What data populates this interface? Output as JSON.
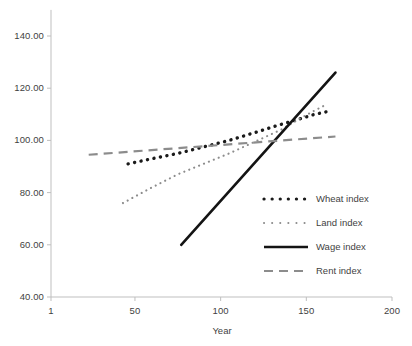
{
  "chart_data": {
    "type": "line",
    "title": "",
    "xlabel": "Year",
    "ylabel": "",
    "xlim": [
      1,
      200
    ],
    "ylim": [
      40,
      150
    ],
    "grid": false,
    "legend_position": "inside-right",
    "x_ticks": [
      "1",
      "50",
      "100",
      "150",
      "200"
    ],
    "x_tick_values": [
      1,
      50,
      100,
      150,
      200
    ],
    "y_ticks": [
      "40.00",
      "60.00",
      "80.00",
      "100.00",
      "120.00",
      "140.00"
    ],
    "y_tick_values": [
      40,
      60,
      80,
      100,
      120,
      140
    ],
    "series": [
      {
        "name": "Wheat index",
        "style": "dotted-bold",
        "color": "#1a1a1a",
        "x": [
          46,
          162
        ],
        "values": [
          91,
          111
        ],
        "points": [
          {
            "x": 46,
            "y": 91
          },
          {
            "x": 60,
            "y": 93
          },
          {
            "x": 75,
            "y": 95
          },
          {
            "x": 90,
            "y": 97.5
          },
          {
            "x": 105,
            "y": 100
          },
          {
            "x": 120,
            "y": 103
          },
          {
            "x": 132,
            "y": 105.5
          },
          {
            "x": 145,
            "y": 108
          },
          {
            "x": 155,
            "y": 110
          },
          {
            "x": 162,
            "y": 111
          }
        ]
      },
      {
        "name": "Land index",
        "style": "dotted-fine",
        "color": "#8c8c8c",
        "x": [
          43,
          161
        ],
        "values": [
          76,
          113.5
        ],
        "points": [
          {
            "x": 43,
            "y": 76
          },
          {
            "x": 60,
            "y": 82
          },
          {
            "x": 75,
            "y": 87
          },
          {
            "x": 90,
            "y": 91
          },
          {
            "x": 105,
            "y": 95
          },
          {
            "x": 120,
            "y": 99.5
          },
          {
            "x": 135,
            "y": 104
          },
          {
            "x": 148,
            "y": 109
          },
          {
            "x": 155,
            "y": 111.5
          },
          {
            "x": 161,
            "y": 113.5
          }
        ]
      },
      {
        "name": "Wage index",
        "style": "solid",
        "color": "#141414",
        "x": [
          77,
          167
        ],
        "values": [
          60,
          126
        ],
        "points": [
          {
            "x": 77,
            "y": 60
          },
          {
            "x": 167,
            "y": 126
          }
        ]
      },
      {
        "name": "Rent index",
        "style": "dashed",
        "color": "#8c8c8c",
        "x": [
          23,
          167
        ],
        "values": [
          94.5,
          101.5
        ],
        "points": [
          {
            "x": 23,
            "y": 94.5
          },
          {
            "x": 167,
            "y": 101.5
          }
        ]
      }
    ]
  },
  "axes": {
    "x_title": "Year",
    "axis_color": "#bfbfbf"
  },
  "legend": {
    "items": [
      {
        "label": "Wheat index",
        "swatch": "dotted-bold-black"
      },
      {
        "label": "Land index",
        "swatch": "dotted-fine-gray"
      },
      {
        "label": "Wage index",
        "swatch": "solid-black"
      },
      {
        "label": "Rent index",
        "swatch": "dashed-gray"
      }
    ]
  },
  "bottom_fragment": "  "
}
